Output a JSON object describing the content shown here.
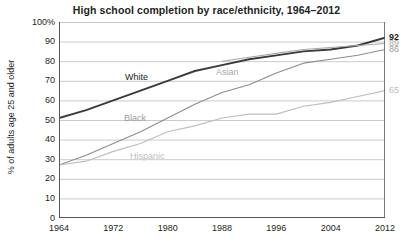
{
  "chart": {
    "title": "High school completion by race/ethnicity, 1964–2012",
    "ylabel": "% of adults age 25 and older",
    "xlabel": ""
  },
  "axis": {
    "yticks": [
      "100%",
      "90",
      "80",
      "70",
      "60",
      "50",
      "40",
      "30",
      "20",
      "10",
      "0"
    ],
    "xticks": [
      "1964",
      "1972",
      "1980",
      "1988",
      "1996",
      "2004",
      "2012"
    ]
  },
  "series_labels": {
    "white": "White",
    "asian": "Asian",
    "black": "Black",
    "hispanic": "Hispanic"
  },
  "end_labels": {
    "white": "92",
    "asian": "89",
    "black": "86",
    "hispanic": "65"
  },
  "colors": {
    "white_line": "#3a3a3a",
    "asian_line": "#a8a8a8",
    "black_line": "#8c8c8c",
    "hispanic_line": "#bdbdbd",
    "gridline": "#b5b5b5",
    "axis": "#58595b",
    "text": "#231f20",
    "muted_text": "#a6a6a6"
  },
  "chart_data": {
    "type": "line",
    "title": "High school completion by race/ethnicity, 1964–2012",
    "xlabel": "",
    "ylabel": "% of adults age 25 and older",
    "xlim": [
      1964,
      2012
    ],
    "ylim": [
      0,
      100
    ],
    "ytick_values": [
      0,
      10,
      20,
      30,
      40,
      50,
      60,
      70,
      80,
      90,
      100
    ],
    "xtick_values": [
      1964,
      1972,
      1980,
      1988,
      1996,
      2004,
      2012
    ],
    "grid": "horizontal",
    "legend": "inline-labels",
    "annotations": [
      {
        "text": "92",
        "series": "White",
        "x": 2012,
        "y": 92
      },
      {
        "text": "89",
        "series": "Asian",
        "x": 2012,
        "y": 89
      },
      {
        "text": "86",
        "series": "Black",
        "x": 2012,
        "y": 86
      },
      {
        "text": "65",
        "series": "Hispanic",
        "x": 2012,
        "y": 65
      }
    ],
    "series": [
      {
        "name": "White",
        "color": "#3a3a3a",
        "x": [
          1964,
          1968,
          1972,
          1976,
          1980,
          1984,
          1988,
          1992,
          1996,
          2000,
          2004,
          2008,
          2012
        ],
        "values": [
          51,
          55,
          60,
          65,
          70,
          75,
          78,
          81,
          83,
          85,
          86,
          88,
          92
        ]
      },
      {
        "name": "Asian",
        "color": "#a8a8a8",
        "x": [
          1988,
          1992,
          1996,
          2000,
          2004,
          2008,
          2012
        ],
        "values": [
          80,
          82,
          84,
          86,
          87,
          88,
          89
        ]
      },
      {
        "name": "Black",
        "color": "#8c8c8c",
        "x": [
          1964,
          1968,
          1972,
          1976,
          1980,
          1984,
          1988,
          1992,
          1996,
          2000,
          2004,
          2008,
          2012
        ],
        "values": [
          27,
          32,
          38,
          44,
          51,
          58,
          64,
          68,
          74,
          79,
          81,
          83,
          86
        ]
      },
      {
        "name": "Hispanic",
        "color": "#bdbdbd",
        "x": [
          1964,
          1968,
          1972,
          1976,
          1980,
          1984,
          1988,
          1992,
          1996,
          2000,
          2004,
          2008,
          2012
        ],
        "values": [
          27,
          29,
          34,
          38,
          44,
          47,
          51,
          53,
          53,
          57,
          59,
          62,
          65
        ]
      }
    ]
  }
}
